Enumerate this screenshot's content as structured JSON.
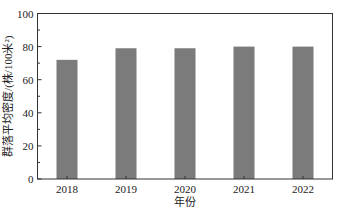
{
  "chart_data": {
    "type": "bar",
    "title": "",
    "xlabel": "年份",
    "ylabel": "群落平均密度/(株/100米²)",
    "categories": [
      "2018",
      "2019",
      "2020",
      "2021",
      "2022"
    ],
    "values": [
      72,
      79,
      79,
      80,
      80
    ],
    "ylim": [
      0,
      100
    ],
    "yticks": [
      0,
      20,
      40,
      60,
      80,
      100
    ],
    "yminor_step": 10,
    "grid": false,
    "legend": null,
    "bar_color": "#7b7b7b",
    "axis_color": "#333333"
  }
}
